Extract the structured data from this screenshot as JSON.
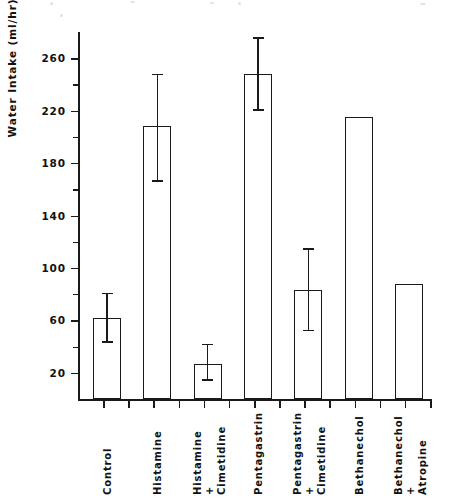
{
  "chart_data": {
    "type": "bar",
    "title": "",
    "subtitle": "",
    "xlabel": "",
    "ylabel": "Water Intake (ml/hr)",
    "ylim": [
      0,
      280
    ],
    "ytick_values": [
      20,
      60,
      100,
      140,
      180,
      220,
      260
    ],
    "ytick_labels": [
      "20",
      "60",
      "100",
      "140",
      "180",
      "220",
      "260"
    ],
    "yminor_values": [
      40,
      80,
      120,
      160,
      200,
      240
    ],
    "grid": false,
    "legend": null,
    "legend_position": "none",
    "bar_style": "open-outline",
    "error_bar_type": "SEM",
    "categories": [
      "Control",
      "Histamine",
      "Histamine\n+\nCimetidine",
      "Pentagastrin",
      "Pentagastrin\n+\nCimetidine",
      "Bethanechol",
      "Bethanechol\n+\nAtropine"
    ],
    "category_labels_rotation": -90,
    "values": [
      62,
      208,
      27,
      248,
      83,
      215,
      88
    ],
    "err_upper": [
      81,
      248,
      42,
      276,
      115,
      null,
      null
    ],
    "err_lower": [
      44,
      167,
      15,
      221,
      53,
      null,
      null
    ],
    "series": [
      {
        "name": "Water Intake",
        "values": [
          62,
          208,
          27,
          248,
          83,
          215,
          88
        ]
      }
    ]
  },
  "axes": {
    "y_title": "Water Intake (ml/hr)"
  }
}
